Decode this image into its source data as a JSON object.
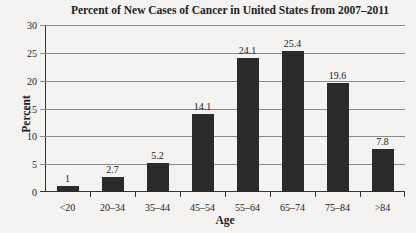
{
  "chart_data": {
    "type": "bar",
    "title": "Percent of New Cases of Cancer in United States from 2007–2011",
    "xlabel": "Age",
    "ylabel": "Percent",
    "categories": [
      "<20",
      "20–34",
      "35–44",
      "45–54",
      "55–64",
      "65–74",
      "75–84",
      ">84"
    ],
    "values": [
      1,
      2.7,
      5.2,
      14.1,
      24.1,
      25.4,
      19.6,
      7.8
    ],
    "data_labels": [
      "1",
      "2.7",
      "5.2",
      "14.1",
      "24.1",
      "25.4",
      "19.6",
      "7.8"
    ],
    "ylim": [
      0,
      30
    ],
    "yticks": [
      0,
      5,
      10,
      15,
      20,
      25,
      30
    ],
    "grid": true,
    "legend": null,
    "bar_color": "#2b2b2b"
  }
}
